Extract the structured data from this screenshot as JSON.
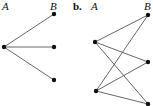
{
  "panel_a": {
    "label_left": "A",
    "label_right": "B",
    "nodes_left": [
      {
        "x": 4,
        "y": 47
      }
    ],
    "nodes_right": [
      {
        "x": 54,
        "y": 14
      },
      {
        "x": 54,
        "y": 47
      },
      {
        "x": 54,
        "y": 80
      }
    ],
    "edges": [
      [
        0,
        0
      ],
      [
        0,
        1
      ],
      [
        0,
        2
      ]
    ]
  },
  "panel_b": {
    "tag": "b.",
    "label_left": "A",
    "label_right": "B",
    "nodes_left": [
      {
        "x": 95,
        "y": 42
      },
      {
        "x": 96,
        "y": 91
      }
    ],
    "nodes_right": [
      {
        "x": 148,
        "y": 15
      },
      {
        "x": 148,
        "y": 62
      },
      {
        "x": 148,
        "y": 104
      }
    ],
    "edges": [
      [
        0,
        0
      ],
      [
        0,
        1
      ],
      [
        0,
        2
      ],
      [
        1,
        0
      ],
      [
        1,
        1
      ],
      [
        1,
        2
      ]
    ]
  }
}
